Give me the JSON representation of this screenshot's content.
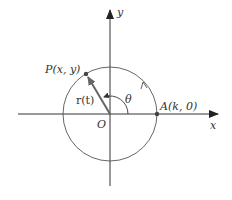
{
  "figure": {
    "labels": {
      "y_axis": "y",
      "x_axis": "x",
      "origin": "O",
      "point_p": "P(x, y)",
      "point_a": "A(k, 0)",
      "vector_r": "r(t)",
      "angle": "θ"
    },
    "colors": {
      "axis": "#333333",
      "circle": "#555555",
      "vector": "#666666",
      "point": "#444444"
    }
  }
}
